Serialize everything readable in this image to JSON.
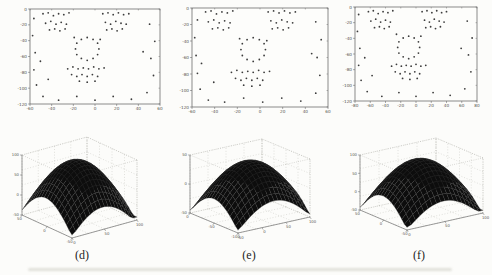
{
  "figure": {
    "panel_labels": [
      "(d)",
      "(e)",
      "(f)"
    ]
  },
  "colors": {
    "marker": "#3c3c3c",
    "axis": "#5a5a5a",
    "tick_label": "#55544e",
    "plot_bg": "#fdfdfb",
    "grid": "#b5b5ae",
    "surface_fill": "#0d0d0d",
    "surface_edge": "#3a3a3a",
    "panel_label": "#1c1c1c"
  },
  "chart_data": [
    {
      "id": "scatter-d",
      "type": "scatter",
      "panel": "(d)",
      "description": "2D facial feature point distribution, panel (d): eyebrow/eye clusters top, circular nose ring center, mouth cluster below, outline points around border",
      "x_ticks": [
        "-60",
        "-40",
        "-20",
        "0",
        "20",
        "40",
        "60"
      ],
      "y_ticks": [
        "0",
        "-20",
        "-40",
        "-60",
        "-80",
        "-100",
        "-120"
      ],
      "points": [
        [
          0.1,
          0.05
        ],
        [
          0.14,
          0.04
        ],
        [
          0.18,
          0.07
        ],
        [
          0.22,
          0.05
        ],
        [
          0.26,
          0.06
        ],
        [
          0.3,
          0.04
        ],
        [
          0.12,
          0.15
        ],
        [
          0.16,
          0.13
        ],
        [
          0.2,
          0.16
        ],
        [
          0.24,
          0.14
        ],
        [
          0.28,
          0.16
        ],
        [
          0.15,
          0.22
        ],
        [
          0.19,
          0.21
        ],
        [
          0.23,
          0.23
        ],
        [
          0.27,
          0.21
        ],
        [
          0.56,
          0.05
        ],
        [
          0.6,
          0.04
        ],
        [
          0.64,
          0.06
        ],
        [
          0.68,
          0.04
        ],
        [
          0.72,
          0.06
        ],
        [
          0.76,
          0.05
        ],
        [
          0.58,
          0.14
        ],
        [
          0.62,
          0.16
        ],
        [
          0.66,
          0.13
        ],
        [
          0.7,
          0.15
        ],
        [
          0.74,
          0.16
        ],
        [
          0.59,
          0.22
        ],
        [
          0.63,
          0.21
        ],
        [
          0.67,
          0.23
        ],
        [
          0.71,
          0.21
        ],
        [
          0.53,
          0.42
        ],
        [
          0.52,
          0.48
        ],
        [
          0.485,
          0.52
        ],
        [
          0.44,
          0.54
        ],
        [
          0.395,
          0.52
        ],
        [
          0.36,
          0.48
        ],
        [
          0.35,
          0.42
        ],
        [
          0.36,
          0.36
        ],
        [
          0.395,
          0.32
        ],
        [
          0.44,
          0.3
        ],
        [
          0.485,
          0.32
        ],
        [
          0.52,
          0.36
        ],
        [
          0.29,
          0.63
        ],
        [
          0.33,
          0.61
        ],
        [
          0.37,
          0.63
        ],
        [
          0.41,
          0.62
        ],
        [
          0.45,
          0.63
        ],
        [
          0.49,
          0.61
        ],
        [
          0.53,
          0.63
        ],
        [
          0.57,
          0.62
        ],
        [
          0.32,
          0.69
        ],
        [
          0.36,
          0.71
        ],
        [
          0.4,
          0.69
        ],
        [
          0.44,
          0.71
        ],
        [
          0.48,
          0.69
        ],
        [
          0.52,
          0.71
        ],
        [
          0.38,
          0.76
        ],
        [
          0.44,
          0.77
        ],
        [
          0.5,
          0.76
        ],
        [
          0.03,
          0.1
        ],
        [
          0.02,
          0.28
        ],
        [
          0.04,
          0.46
        ],
        [
          0.03,
          0.64
        ],
        [
          0.05,
          0.8
        ],
        [
          0.1,
          0.92
        ],
        [
          0.22,
          0.96
        ],
        [
          0.36,
          0.92
        ],
        [
          0.5,
          0.96
        ],
        [
          0.64,
          0.92
        ],
        [
          0.78,
          0.95
        ],
        [
          0.9,
          0.88
        ],
        [
          0.95,
          0.7
        ],
        [
          0.93,
          0.52
        ],
        [
          0.96,
          0.34
        ],
        [
          0.92,
          0.16
        ],
        [
          0.34,
          0.3
        ],
        [
          0.54,
          0.32
        ],
        [
          0.08,
          0.55
        ],
        [
          0.87,
          0.45
        ],
        [
          0.14,
          0.74
        ]
      ]
    },
    {
      "id": "scatter-e",
      "type": "scatter",
      "panel": "(e)",
      "description": "2D facial feature point distribution, panel (e)",
      "x_ticks": [
        "-60",
        "-40",
        "-20",
        "0",
        "20",
        "40",
        "60"
      ],
      "y_ticks": [
        "0",
        "-20",
        "-40",
        "-60",
        "-80",
        "-100",
        "-120"
      ],
      "points": [
        [
          0.1,
          0.04
        ],
        [
          0.14,
          0.03
        ],
        [
          0.18,
          0.06
        ],
        [
          0.22,
          0.04
        ],
        [
          0.26,
          0.05
        ],
        [
          0.3,
          0.03
        ],
        [
          0.12,
          0.14
        ],
        [
          0.16,
          0.12
        ],
        [
          0.2,
          0.15
        ],
        [
          0.24,
          0.13
        ],
        [
          0.28,
          0.15
        ],
        [
          0.15,
          0.21
        ],
        [
          0.19,
          0.2
        ],
        [
          0.23,
          0.22
        ],
        [
          0.27,
          0.2
        ],
        [
          0.56,
          0.04
        ],
        [
          0.6,
          0.03
        ],
        [
          0.64,
          0.05
        ],
        [
          0.68,
          0.03
        ],
        [
          0.72,
          0.05
        ],
        [
          0.76,
          0.04
        ],
        [
          0.58,
          0.13
        ],
        [
          0.62,
          0.15
        ],
        [
          0.66,
          0.12
        ],
        [
          0.7,
          0.14
        ],
        [
          0.74,
          0.15
        ],
        [
          0.59,
          0.21
        ],
        [
          0.63,
          0.2
        ],
        [
          0.67,
          0.22
        ],
        [
          0.71,
          0.2
        ],
        [
          0.54,
          0.42
        ],
        [
          0.53,
          0.48
        ],
        [
          0.495,
          0.52
        ],
        [
          0.45,
          0.54
        ],
        [
          0.405,
          0.52
        ],
        [
          0.37,
          0.48
        ],
        [
          0.36,
          0.42
        ],
        [
          0.37,
          0.36
        ],
        [
          0.405,
          0.32
        ],
        [
          0.45,
          0.3
        ],
        [
          0.495,
          0.32
        ],
        [
          0.53,
          0.36
        ],
        [
          0.29,
          0.65
        ],
        [
          0.33,
          0.63
        ],
        [
          0.37,
          0.65
        ],
        [
          0.41,
          0.64
        ],
        [
          0.45,
          0.65
        ],
        [
          0.49,
          0.63
        ],
        [
          0.53,
          0.65
        ],
        [
          0.57,
          0.64
        ],
        [
          0.32,
          0.71
        ],
        [
          0.36,
          0.73
        ],
        [
          0.4,
          0.71
        ],
        [
          0.44,
          0.73
        ],
        [
          0.48,
          0.71
        ],
        [
          0.52,
          0.73
        ],
        [
          0.38,
          0.78
        ],
        [
          0.44,
          0.79
        ],
        [
          0.5,
          0.78
        ],
        [
          0.04,
          0.12
        ],
        [
          0.02,
          0.3
        ],
        [
          0.03,
          0.48
        ],
        [
          0.04,
          0.66
        ],
        [
          0.06,
          0.82
        ],
        [
          0.12,
          0.93
        ],
        [
          0.24,
          0.95
        ],
        [
          0.38,
          0.91
        ],
        [
          0.52,
          0.95
        ],
        [
          0.66,
          0.91
        ],
        [
          0.8,
          0.94
        ],
        [
          0.91,
          0.86
        ],
        [
          0.94,
          0.68
        ],
        [
          0.92,
          0.5
        ],
        [
          0.95,
          0.32
        ],
        [
          0.91,
          0.14
        ],
        [
          0.35,
          0.31
        ],
        [
          0.55,
          0.33
        ],
        [
          0.07,
          0.56
        ],
        [
          0.88,
          0.46
        ],
        [
          0.16,
          0.75
        ]
      ]
    },
    {
      "id": "scatter-f",
      "type": "scatter",
      "panel": "(f)",
      "description": "2D facial feature point distribution, panel (f)",
      "x_ticks": [
        "-80",
        "-60",
        "-40",
        "-20",
        "0",
        "20",
        "40",
        "60",
        "80"
      ],
      "y_ticks": [
        "0",
        "-20",
        "-40",
        "-60",
        "-80",
        "-100",
        "-120"
      ],
      "points": [
        [
          0.11,
          0.05
        ],
        [
          0.15,
          0.04
        ],
        [
          0.19,
          0.07
        ],
        [
          0.23,
          0.05
        ],
        [
          0.27,
          0.06
        ],
        [
          0.31,
          0.04
        ],
        [
          0.13,
          0.15
        ],
        [
          0.17,
          0.13
        ],
        [
          0.21,
          0.16
        ],
        [
          0.25,
          0.14
        ],
        [
          0.29,
          0.16
        ],
        [
          0.16,
          0.22
        ],
        [
          0.2,
          0.21
        ],
        [
          0.24,
          0.23
        ],
        [
          0.28,
          0.21
        ],
        [
          0.55,
          0.05
        ],
        [
          0.59,
          0.04
        ],
        [
          0.63,
          0.06
        ],
        [
          0.67,
          0.04
        ],
        [
          0.71,
          0.06
        ],
        [
          0.75,
          0.05
        ],
        [
          0.57,
          0.14
        ],
        [
          0.61,
          0.16
        ],
        [
          0.65,
          0.13
        ],
        [
          0.69,
          0.15
        ],
        [
          0.73,
          0.16
        ],
        [
          0.58,
          0.22
        ],
        [
          0.62,
          0.21
        ],
        [
          0.66,
          0.23
        ],
        [
          0.7,
          0.21
        ],
        [
          0.53,
          0.43
        ],
        [
          0.52,
          0.49
        ],
        [
          0.485,
          0.53
        ],
        [
          0.44,
          0.55
        ],
        [
          0.395,
          0.53
        ],
        [
          0.36,
          0.49
        ],
        [
          0.35,
          0.43
        ],
        [
          0.36,
          0.37
        ],
        [
          0.395,
          0.33
        ],
        [
          0.44,
          0.31
        ],
        [
          0.485,
          0.33
        ],
        [
          0.52,
          0.37
        ],
        [
          0.3,
          0.63
        ],
        [
          0.34,
          0.61
        ],
        [
          0.38,
          0.63
        ],
        [
          0.42,
          0.62
        ],
        [
          0.46,
          0.63
        ],
        [
          0.5,
          0.61
        ],
        [
          0.54,
          0.63
        ],
        [
          0.58,
          0.62
        ],
        [
          0.33,
          0.69
        ],
        [
          0.37,
          0.71
        ],
        [
          0.41,
          0.69
        ],
        [
          0.45,
          0.71
        ],
        [
          0.49,
          0.69
        ],
        [
          0.53,
          0.71
        ],
        [
          0.39,
          0.76
        ],
        [
          0.45,
          0.77
        ],
        [
          0.51,
          0.76
        ],
        [
          0.03,
          0.08
        ],
        [
          0.02,
          0.26
        ],
        [
          0.04,
          0.44
        ],
        [
          0.03,
          0.62
        ],
        [
          0.05,
          0.78
        ],
        [
          0.1,
          0.9
        ],
        [
          0.22,
          0.95
        ],
        [
          0.36,
          0.91
        ],
        [
          0.5,
          0.95
        ],
        [
          0.64,
          0.91
        ],
        [
          0.78,
          0.94
        ],
        [
          0.9,
          0.87
        ],
        [
          0.95,
          0.69
        ],
        [
          0.93,
          0.51
        ],
        [
          0.96,
          0.33
        ],
        [
          0.92,
          0.15
        ],
        [
          0.34,
          0.29
        ],
        [
          0.54,
          0.31
        ],
        [
          0.08,
          0.54
        ],
        [
          0.87,
          0.44
        ],
        [
          0.14,
          0.73
        ]
      ]
    },
    {
      "id": "surface-d",
      "type": "surface",
      "panel": "(d)",
      "description": "3D similarity surface, panel (d): dark mesh dome with central peak, corners falling to base plane",
      "x_ticks": [
        "0",
        "50",
        "100"
      ],
      "y_ticks": [
        "-50",
        "0",
        "50"
      ],
      "z_ticks": [
        "100",
        "50",
        "0",
        "-50"
      ],
      "surface_model": {
        "peak_center_x": 0.47,
        "peak_center_y": 0.52,
        "peak_height": 0.9,
        "base": 0.05,
        "radius": 1.38
      }
    },
    {
      "id": "surface-e",
      "type": "surface",
      "panel": "(e)",
      "description": "3D similarity surface, panel (e): dark mesh dome with central peak",
      "x_ticks": [
        "-50",
        "0",
        "50",
        "100"
      ],
      "y_ticks": [
        "-100",
        "-50",
        "0"
      ],
      "z_ticks": [
        "50",
        "0",
        "-50"
      ],
      "surface_model": {
        "peak_center_x": 0.5,
        "peak_center_y": 0.5,
        "peak_height": 0.88,
        "base": 0.05,
        "radius": 1.4
      }
    },
    {
      "id": "surface-f",
      "type": "surface",
      "panel": "(f)",
      "description": "3D similarity surface, panel (f): dark mesh dome with central peak",
      "x_ticks": [
        "0",
        "50",
        "100"
      ],
      "y_ticks": [
        "-50",
        "0",
        "50"
      ],
      "z_ticks": [
        "100",
        "50",
        "0",
        "-50"
      ],
      "surface_model": {
        "peak_center_x": 0.48,
        "peak_center_y": 0.51,
        "peak_height": 0.9,
        "base": 0.05,
        "radius": 1.36
      }
    }
  ]
}
